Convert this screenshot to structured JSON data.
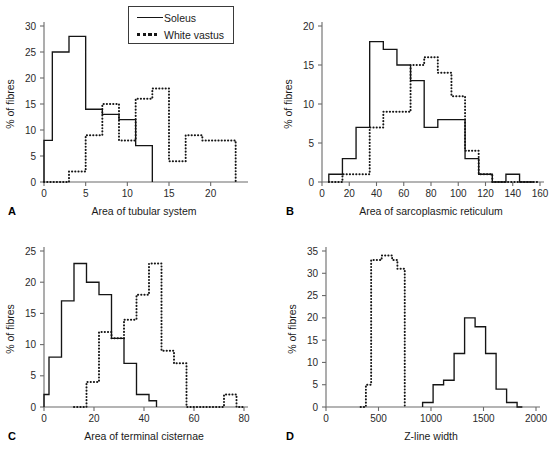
{
  "figure": {
    "legend": {
      "title": "",
      "entries": [
        {
          "label": "Soleus",
          "style": "solid"
        },
        {
          "label": "White vastus",
          "style": "dotted"
        }
      ]
    },
    "bottom_caption": "",
    "panels": [
      {
        "letter": "A",
        "xlabel": "Area of tubular system",
        "ylabel": "% of fibres"
      },
      {
        "letter": "B",
        "xlabel": "Area of sarcoplasmic reticulum",
        "ylabel": "% of fibres"
      },
      {
        "letter": "C",
        "xlabel": "Area of terminal cisternae",
        "ylabel": "% of fibres"
      },
      {
        "letter": "D",
        "xlabel": "Z-line width",
        "ylabel": "% of fibres"
      }
    ]
  },
  "chart_data": [
    {
      "type": "line",
      "panel": "A",
      "title": "",
      "xlabel": "Area of tubular system",
      "ylabel": "% of fibres",
      "xlim": [
        0,
        24
      ],
      "ylim": [
        0,
        30
      ],
      "xticks": [
        0,
        5,
        10,
        15,
        20
      ],
      "yticks": [
        0,
        5,
        10,
        15,
        20,
        25,
        30
      ],
      "grid": false,
      "legend_position": "top-center-outside",
      "bin_width": 2,
      "series": [
        {
          "name": "Soleus",
          "style": "solid",
          "bin_edges": [
            0,
            1,
            3,
            5,
            7,
            9,
            11,
            13
          ],
          "values": [
            8,
            25,
            28,
            14,
            13,
            12,
            7
          ]
        },
        {
          "name": "White vastus",
          "style": "dotted",
          "bin_edges": [
            0,
            3,
            5,
            7,
            9,
            11,
            13,
            15,
            17,
            19,
            23
          ],
          "values": [
            0,
            2,
            9,
            15,
            8,
            16,
            18,
            4,
            9,
            8
          ]
        }
      ]
    },
    {
      "type": "line",
      "panel": "B",
      "title": "",
      "xlabel": "Area of sarcoplasmic reticulum",
      "ylabel": "% of fibres",
      "xlim": [
        0,
        160
      ],
      "ylim": [
        0,
        20
      ],
      "xticks": [
        0,
        20,
        40,
        60,
        80,
        100,
        120,
        140,
        160
      ],
      "yticks": [
        0,
        5,
        10,
        15,
        20
      ],
      "grid": false,
      "legend_position": "none",
      "bin_width": 10,
      "series": [
        {
          "name": "Soleus",
          "style": "solid",
          "bin_edges": [
            5,
            15,
            25,
            35,
            45,
            55,
            65,
            75,
            85,
            95,
            105,
            115,
            125,
            135,
            145,
            155
          ],
          "values": [
            1,
            3,
            7,
            18,
            17,
            15,
            13,
            7,
            8,
            8,
            3,
            1,
            0,
            1,
            0
          ]
        },
        {
          "name": "White vastus",
          "style": "dotted",
          "bin_edges": [
            5,
            15,
            25,
            35,
            45,
            55,
            65,
            75,
            85,
            95,
            105,
            115,
            125,
            135,
            145,
            160
          ],
          "values": [
            0,
            1,
            1,
            7,
            9,
            9,
            15,
            16,
            14,
            11,
            4,
            1,
            0,
            0,
            0
          ]
        }
      ]
    },
    {
      "type": "line",
      "panel": "C",
      "title": "",
      "xlabel": "Area of terminal cisternae",
      "ylabel": "% of fibres",
      "xlim": [
        0,
        80
      ],
      "ylim": [
        0,
        25
      ],
      "xticks": [
        0,
        20,
        40,
        60,
        80
      ],
      "yticks": [
        0,
        5,
        10,
        15,
        20,
        25
      ],
      "grid": false,
      "legend_position": "none",
      "bin_width": 5,
      "series": [
        {
          "name": "Soleus",
          "style": "solid",
          "bin_edges": [
            0,
            2,
            7,
            12,
            17,
            22,
            27,
            32,
            37,
            42,
            45
          ],
          "values": [
            2,
            8,
            17,
            23,
            20,
            18,
            11,
            7,
            2,
            1
          ]
        },
        {
          "name": "White vastus",
          "style": "dotted",
          "bin_edges": [
            12,
            17,
            22,
            27,
            32,
            37,
            42,
            47,
            52,
            57,
            72,
            77,
            80
          ],
          "values": [
            0,
            4,
            12,
            11,
            14,
            18,
            23,
            9,
            7,
            0,
            2,
            0
          ]
        }
      ]
    },
    {
      "type": "line",
      "panel": "D",
      "title": "",
      "xlabel": "Z-line width",
      "ylabel": "% of fibres",
      "xlim": [
        0,
        2000
      ],
      "ylim": [
        0,
        35
      ],
      "xticks": [
        0,
        500,
        1000,
        1500,
        2000
      ],
      "yticks": [
        0,
        5,
        10,
        15,
        20,
        25,
        30,
        35
      ],
      "grid": false,
      "legend_position": "none",
      "bin_width": 100,
      "series": [
        {
          "name": "Soleus",
          "style": "solid",
          "bin_edges": [
            920,
            1020,
            1120,
            1220,
            1320,
            1420,
            1520,
            1620,
            1720,
            1820,
            1870
          ],
          "values": [
            1,
            5,
            6,
            12,
            20,
            18,
            12,
            4,
            1,
            0
          ]
        },
        {
          "name": "White vastus",
          "style": "dotted",
          "bin_edges": [
            330,
            380,
            430,
            530,
            630,
            680,
            750
          ],
          "values": [
            0,
            5,
            33,
            34,
            33,
            31
          ]
        }
      ]
    }
  ]
}
